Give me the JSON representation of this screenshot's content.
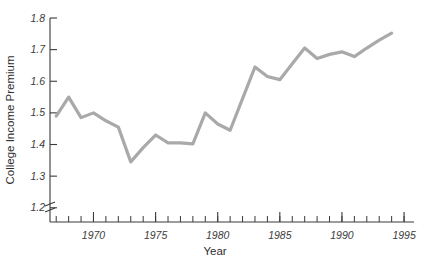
{
  "chart_data": {
    "type": "line",
    "title": "",
    "xlabel": "Year",
    "ylabel": "College Income Premium",
    "xlim": [
      1966.5,
      1995.8
    ],
    "ylim": [
      1.155,
      1.8
    ],
    "grid": false,
    "legend": false,
    "axis_break_y": true,
    "line_color": "#a9a9a9",
    "axis_color": "#3a3a3a",
    "x_major_ticks": [
      1970,
      1975,
      1980,
      1985,
      1990,
      1995
    ],
    "x_major_tick_labels": [
      "1970",
      "1975",
      "1980",
      "1985",
      "1990",
      "1995"
    ],
    "x_minor_tick_step": 1,
    "y_ticks": [
      1.2,
      1.3,
      1.4,
      1.5,
      1.6,
      1.7,
      1.8
    ],
    "y_tick_labels": [
      "1.2",
      "1.3",
      "1.4",
      "1.5",
      "1.6",
      "1.7",
      "1.8"
    ],
    "x": [
      1967,
      1968,
      1969,
      1970,
      1971,
      1972,
      1973,
      1974,
      1975,
      1976,
      1977,
      1978,
      1979,
      1980,
      1981,
      1982,
      1983,
      1984,
      1985,
      1986,
      1987,
      1988,
      1989,
      1990,
      1991,
      1992,
      1993,
      1994
    ],
    "values": [
      1.49,
      1.55,
      1.485,
      1.5,
      1.475,
      1.455,
      1.345,
      1.39,
      1.43,
      1.405,
      1.405,
      1.402,
      1.5,
      1.465,
      1.445,
      1.545,
      1.645,
      1.615,
      1.605,
      1.655,
      1.705,
      1.672,
      1.685,
      1.693,
      1.678,
      1.705,
      1.73,
      1.752
    ],
    "series": [
      {
        "name": "College Income Premium",
        "values": [
          1.49,
          1.55,
          1.485,
          1.5,
          1.475,
          1.455,
          1.345,
          1.39,
          1.43,
          1.405,
          1.405,
          1.402,
          1.5,
          1.465,
          1.445,
          1.545,
          1.645,
          1.615,
          1.605,
          1.655,
          1.705,
          1.672,
          1.685,
          1.693,
          1.678,
          1.705,
          1.73,
          1.752
        ]
      }
    ]
  }
}
